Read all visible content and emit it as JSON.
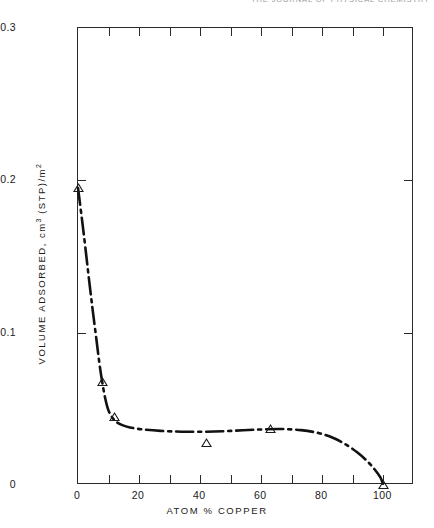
{
  "page": {
    "header_running_text": "THE JOURNAL OF PHYSICAL CHEMISTRY"
  },
  "chart_data": {
    "type": "line",
    "title": "",
    "xlabel": "ATOM % COPPER",
    "ylabel": "VOLUME ADSORBED, cm 3 (STP)/m 2",
    "ylabel_parts": {
      "lead": "VOLUME ADSORBED, cm",
      "sup1": "3",
      "mid": " (STP)/m",
      "sup2": "2"
    },
    "xlim": [
      0,
      110
    ],
    "ylim": [
      0,
      0.3
    ],
    "grid": false,
    "legend": null,
    "x_ticks_major": [
      0,
      20,
      40,
      60,
      80,
      100
    ],
    "x_tick_labels": [
      "0",
      "20",
      "40",
      "60",
      "80",
      "100"
    ],
    "x_ticks_minor": [
      10,
      30,
      50,
      70,
      90
    ],
    "y_ticks_major": [
      0,
      0.1,
      0.2,
      0.3
    ],
    "y_tick_labels": [
      "0",
      "0.1",
      "0.2",
      "0.3"
    ],
    "line_style": "dash-dot",
    "line_color": "#111111",
    "marker": "open-triangle",
    "marker_color": "#1a1a1a",
    "points": [
      {
        "x": 0,
        "y": 0.195
      },
      {
        "x": 8,
        "y": 0.068
      },
      {
        "x": 12,
        "y": 0.045
      },
      {
        "x": 42,
        "y": 0.028
      },
      {
        "x": 63,
        "y": 0.037
      },
      {
        "x": 100,
        "y": 0.0
      }
    ],
    "curve": [
      {
        "x": 0.0,
        "y": 0.195
      },
      {
        "x": 1.2,
        "y": 0.176
      },
      {
        "x": 2.4,
        "y": 0.156
      },
      {
        "x": 3.6,
        "y": 0.135
      },
      {
        "x": 4.8,
        "y": 0.115
      },
      {
        "x": 6.0,
        "y": 0.096
      },
      {
        "x": 7.0,
        "y": 0.08
      },
      {
        "x": 7.9,
        "y": 0.068
      },
      {
        "x": 8.8,
        "y": 0.058
      },
      {
        "x": 9.8,
        "y": 0.05
      },
      {
        "x": 11.0,
        "y": 0.045
      },
      {
        "x": 12.5,
        "y": 0.0415
      },
      {
        "x": 14.5,
        "y": 0.0393
      },
      {
        "x": 17.0,
        "y": 0.0378
      },
      {
        "x": 21.0,
        "y": 0.0365
      },
      {
        "x": 27.0,
        "y": 0.0355
      },
      {
        "x": 34.0,
        "y": 0.035
      },
      {
        "x": 42.0,
        "y": 0.035
      },
      {
        "x": 50.0,
        "y": 0.0355
      },
      {
        "x": 58.0,
        "y": 0.0363
      },
      {
        "x": 66.0,
        "y": 0.0368
      },
      {
        "x": 73.0,
        "y": 0.036
      },
      {
        "x": 79.0,
        "y": 0.034
      },
      {
        "x": 84.0,
        "y": 0.0305
      },
      {
        "x": 88.0,
        "y": 0.0262
      },
      {
        "x": 91.5,
        "y": 0.0213
      },
      {
        "x": 94.5,
        "y": 0.016
      },
      {
        "x": 97.0,
        "y": 0.0105
      },
      {
        "x": 99.0,
        "y": 0.005
      },
      {
        "x": 100.0,
        "y": 0.0
      }
    ]
  }
}
